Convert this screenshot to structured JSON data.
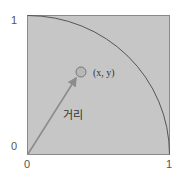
{
  "diagram": {
    "axis": {
      "y_max_label": "1",
      "y_min_label": "0",
      "x_min_label": "0",
      "x_max_label": "1"
    },
    "point_label": "(x, y)",
    "distance_label": "거리",
    "colors": {
      "square_fill": "#c6c6c6",
      "square_stroke": "#8a8a8a",
      "arc": "#555555",
      "arrow": "#8c8c8c",
      "point_stroke": "#777777",
      "point_fill": "#b8b8b8"
    }
  }
}
